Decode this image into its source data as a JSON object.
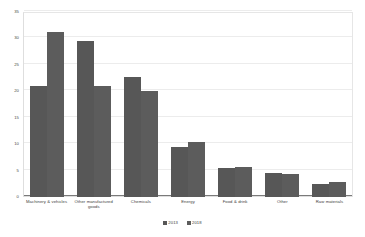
{
  "chart_data": {
    "type": "bar",
    "title": "",
    "subtitle": "",
    "xlabel": "",
    "ylabel": "",
    "ylim": [
      0,
      35
    ],
    "ytick_step": 5,
    "yticks": [
      0,
      5,
      10,
      15,
      20,
      25,
      30,
      35
    ],
    "ytick_labels": [
      "0",
      "5",
      "10",
      "15",
      "20",
      "25",
      "30",
      "35"
    ],
    "grid": true,
    "legend_position": "bottom",
    "categories": [
      "Machinery & vehicles",
      "Other manufactured goods",
      "Chemicals",
      "Energy",
      "Food & drink",
      "Other",
      "Raw materials"
    ],
    "series": [
      {
        "name": "2013",
        "color": "#575757",
        "values": [
          21.0,
          29.6,
          22.8,
          9.4,
          5.5,
          4.6,
          2.5
        ]
      },
      {
        "name": "2018",
        "color": "#5c5c5c",
        "values": [
          31.2,
          21.0,
          20.0,
          10.4,
          5.7,
          4.3,
          2.9
        ]
      }
    ]
  },
  "axis": {
    "y_tick_labels": [
      "35",
      "30",
      "25",
      "20",
      "15",
      "10",
      "5",
      "0"
    ]
  },
  "legend": {
    "items": [
      {
        "label": "2013",
        "color": "#575757"
      },
      {
        "label": "2018",
        "color": "#5c5c5c"
      }
    ]
  },
  "colors": {
    "series_1": "#575757",
    "series_2": "#5c5c5c",
    "gridline": "#ececec",
    "axis": "#7a7a7a",
    "text": "#3d3d3d",
    "background": "#ffffff"
  }
}
